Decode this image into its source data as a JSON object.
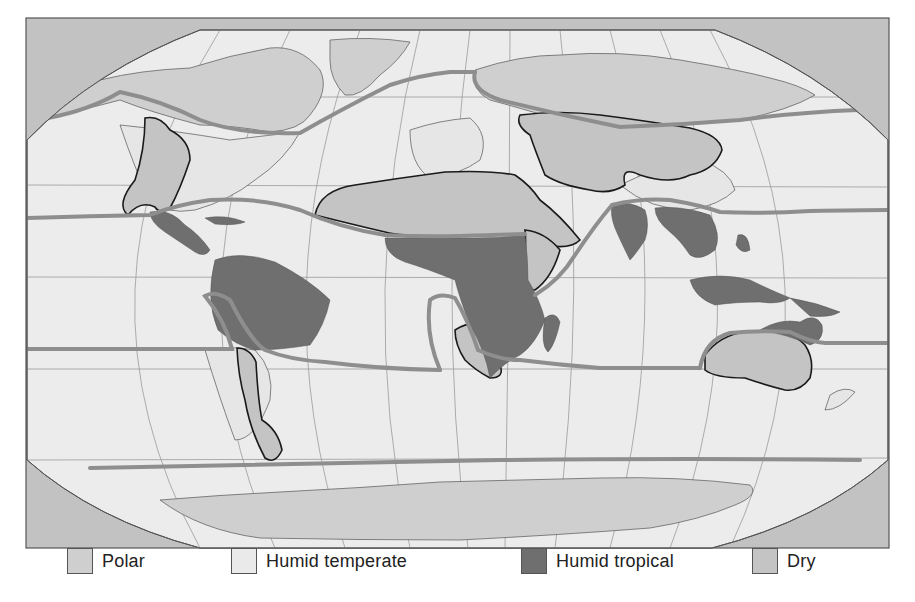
{
  "map": {
    "title": "World climate regions",
    "projection": "Robinson-like world projection",
    "colors": {
      "ocean": "#ececec",
      "frame_corner": "#c2c2c2",
      "polar": "#cfcfcf",
      "humid_temperate": "#eaeaea",
      "humid_tropical": "#6f6f6f",
      "dry": "#c4c4c4",
      "boundary_thick": "#8e8e8e",
      "boundary_dry": "#1a1a1a",
      "graticule": "#9a9a9a"
    }
  },
  "legend": {
    "items": [
      {
        "key": "polar",
        "label": "Polar",
        "color": "#cfcfcf"
      },
      {
        "key": "humid_temperate",
        "label": "Humid temperate",
        "color": "#eaeaea"
      },
      {
        "key": "humid_tropical",
        "label": "Humid tropical",
        "color": "#6f6f6f"
      },
      {
        "key": "dry",
        "label": "Dry",
        "color": "#c4c4c4"
      }
    ]
  }
}
